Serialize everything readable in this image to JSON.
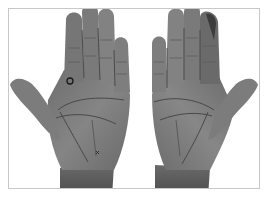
{
  "image": {
    "subject": "two open palms, left and right hands",
    "style": "grayscale photograph",
    "marker": {
      "shape": "circle",
      "location": "left palm, below index finger"
    }
  },
  "colors": {
    "background": "#ffffff",
    "frame_border": "#c8c8c8",
    "skin_dark": "#5a5a5a",
    "skin_mid": "#7a7a7a",
    "skin_light": "#9a9a9a",
    "palm_lines": "#444444",
    "marker": "#1a1a1a"
  }
}
